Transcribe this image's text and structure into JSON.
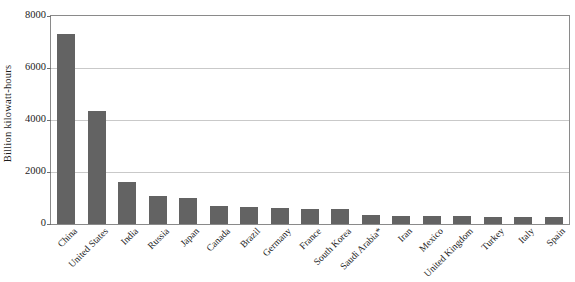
{
  "chart_data": {
    "type": "bar",
    "title": "",
    "subtitle": "",
    "xlabel": "",
    "ylabel": "Billion  kilowatt-hours",
    "ylim": [
      0,
      8000
    ],
    "ytick_values": [
      0,
      2000,
      4000,
      6000,
      8000
    ],
    "ytick_labels": [
      "0",
      "2000",
      "4000",
      "6000",
      "8000"
    ],
    "grid": true,
    "legend": false,
    "legend_position": "none",
    "orientation": "vertical",
    "bar_color": "#636363",
    "categories": [
      "China",
      "United States",
      "India",
      "Russia",
      "Japan",
      "Canada",
      "Brazil",
      "Germany",
      "France",
      "South Korea",
      "Saudi Arabia*",
      "Iran",
      "Mexico",
      "United Kingdom",
      "Turkey",
      "Italy",
      "Spain"
    ],
    "values": [
      7300,
      4350,
      1600,
      1070,
      1000,
      690,
      660,
      620,
      570,
      560,
      340,
      300,
      300,
      300,
      270,
      260,
      260
    ],
    "annotations": [
      "* Saudi Arabia marked with asterisk footnote"
    ]
  },
  "figure": {
    "source_note": ""
  },
  "axis": {
    "y_title": "Billion  kilowatt-hours"
  }
}
